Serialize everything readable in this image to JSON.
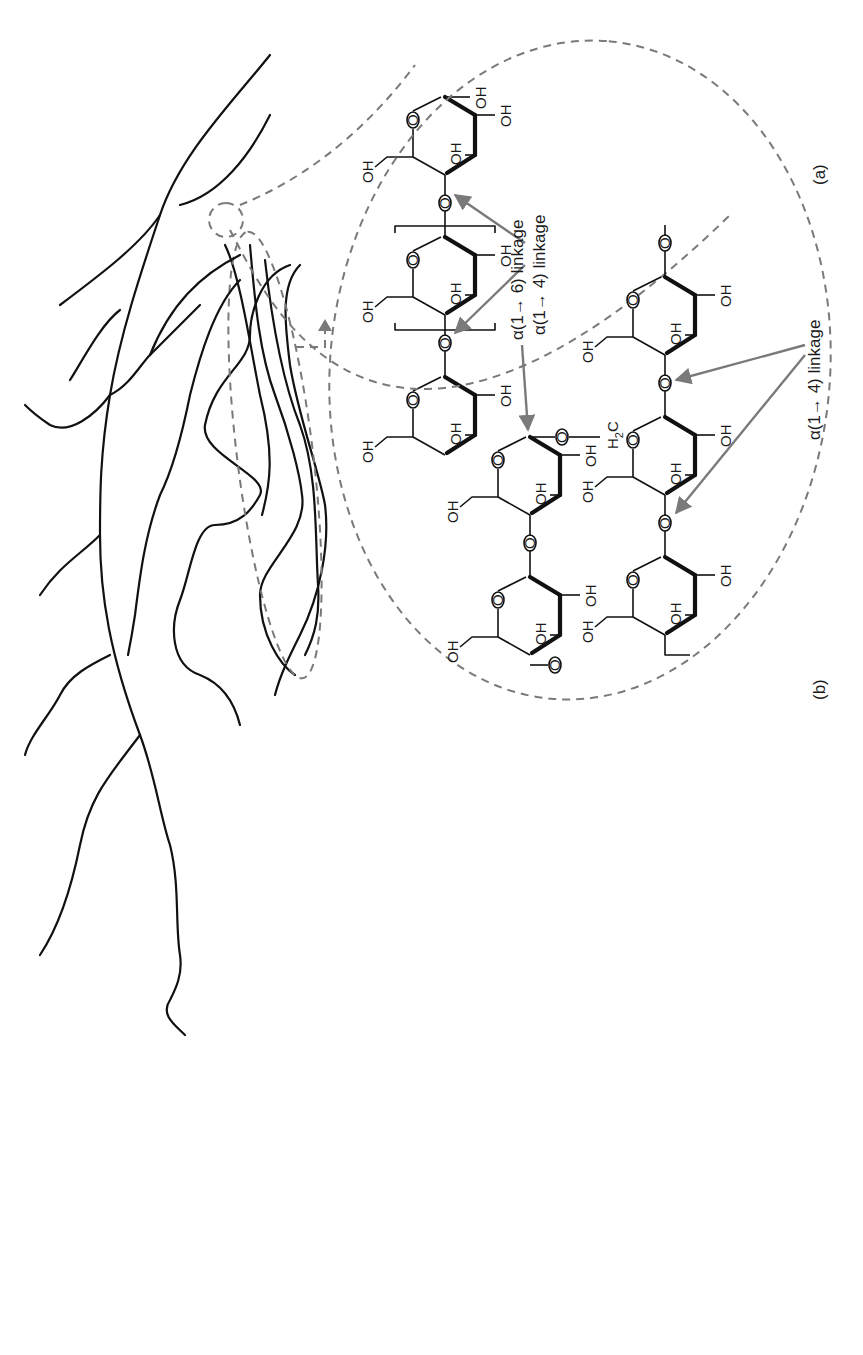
{
  "figure": {
    "orientation": "rotated 90 degrees counter-clockwise",
    "panels": [
      {
        "id": "a",
        "label": "(a)",
        "subject": "linear polysaccharide chain (amylose)",
        "linkage_label": "α(1→ 4) linkage",
        "repeat_subscript": "n",
        "ring_substituents": [
          "OH",
          "OH",
          "OH",
          "OH"
        ],
        "anomeric_oh": "OH"
      },
      {
        "id": "b",
        "label": "(b)",
        "subject": "branched polysaccharide (amylopectin)",
        "branch_linkage_label": "α(1→ 6) linkage",
        "chain_linkage_label": "α(1→ 4) linkage",
        "bridge_group": "H2C",
        "bridge_group_main": "H",
        "bridge_group_sub": "2",
        "bridge_group_tail": "C",
        "ring_substituents": [
          "OH",
          "OH",
          "OH"
        ]
      }
    ],
    "atoms": {
      "oxygen": "O",
      "hydroxyl": "OH",
      "chain_end": "—O—"
    },
    "colors": {
      "line": "#111111",
      "dashed_outline": "#7a7a7a",
      "arrow": "#7a7a7a",
      "background": "#ffffff"
    }
  }
}
